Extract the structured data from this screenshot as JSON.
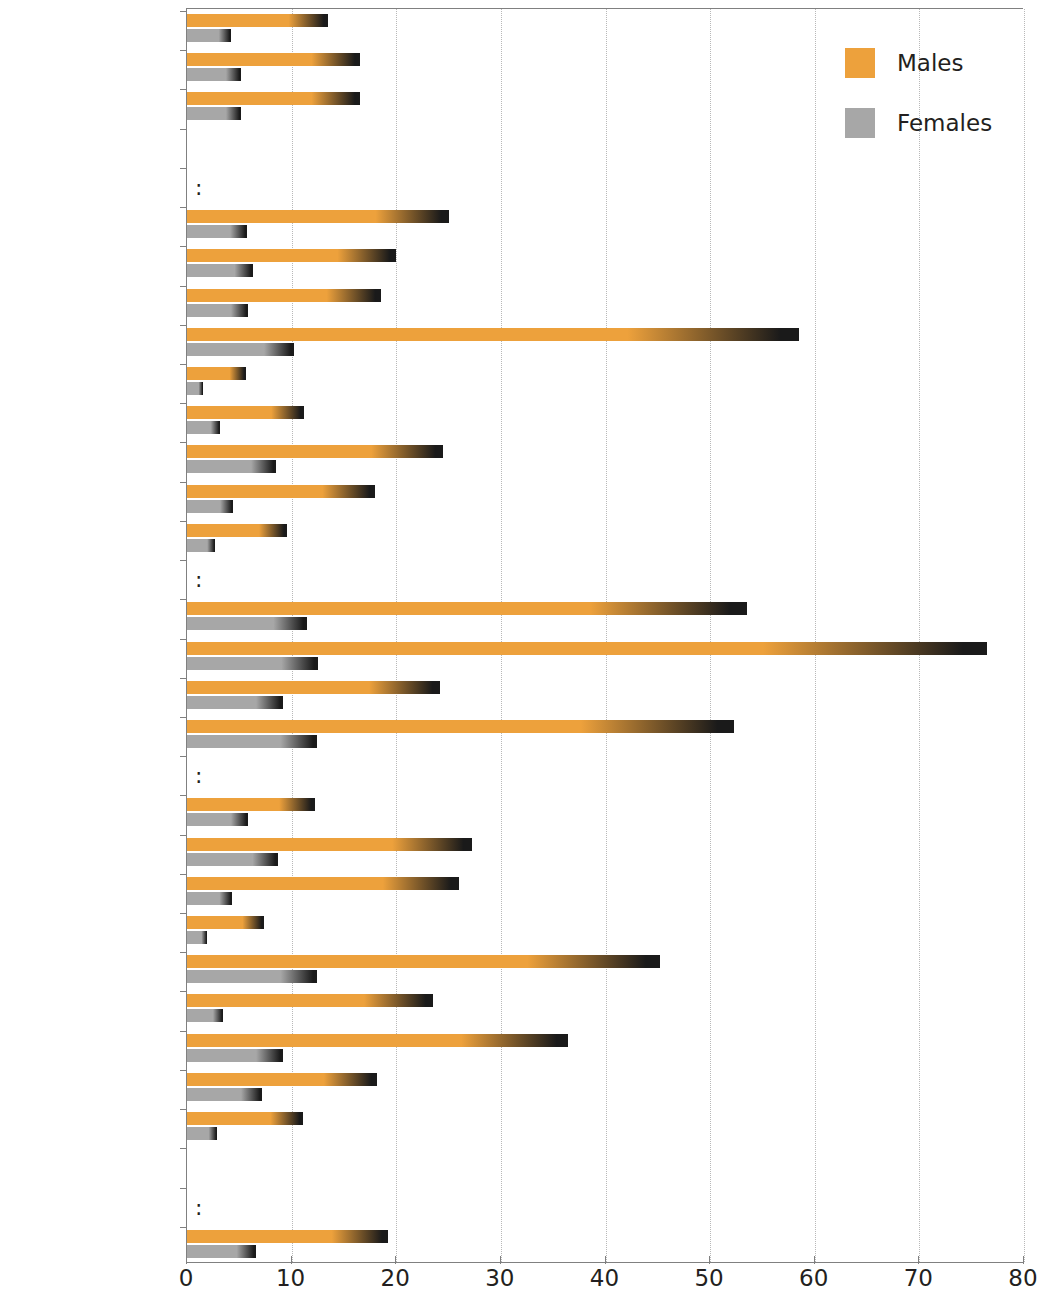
{
  "chart_data": {
    "type": "bar",
    "orientation": "horizontal",
    "title": "",
    "xlabel": "",
    "ylabel": "",
    "xlim": [
      0,
      80
    ],
    "xticks": [
      0,
      10,
      20,
      30,
      40,
      50,
      60,
      70,
      80
    ],
    "grid": "vertical dotted gridlines at each x tick",
    "legend_position": "top-right",
    "no_data_marker": ":",
    "categories": [
      "EU-25",
      "EU-15",
      "Euro-zone",
      "",
      "Belgium",
      "Czech Republic",
      "Denmark",
      "Germany",
      "Estonia",
      "Greece",
      "Spain",
      "France",
      "Ireland",
      "Italy",
      "Cyprus",
      "Latvia",
      "Lithuania",
      "Luxembourg",
      "Hungary",
      "Malta",
      "Netherlands",
      "Austria",
      "Poland",
      "Portugal",
      "Slovenia",
      "Slovakia",
      "Finland",
      "Sweden",
      "United Kingdom",
      "",
      "Iceland",
      "Norway"
    ],
    "series": [
      {
        "name": "Males",
        "color": "#eda13c",
        "values": [
          13.5,
          16.5,
          16.5,
          null,
          null,
          25.0,
          20.0,
          18.5,
          58.5,
          5.6,
          11.2,
          24.5,
          18.0,
          9.6,
          null,
          53.5,
          76.5,
          24.2,
          52.3,
          null,
          12.2,
          27.2,
          26.0,
          7.4,
          45.2,
          23.5,
          36.4,
          18.2,
          11.1,
          null,
          null,
          19.2
        ]
      },
      {
        "name": "Females",
        "color": "#a7a7a7",
        "values": [
          4.2,
          5.2,
          5.2,
          null,
          null,
          5.7,
          6.3,
          5.8,
          10.2,
          1.5,
          3.2,
          8.5,
          4.4,
          2.7,
          null,
          11.5,
          12.5,
          9.2,
          12.4,
          null,
          5.8,
          8.7,
          4.3,
          1.9,
          12.4,
          3.4,
          9.2,
          7.2,
          2.9,
          null,
          null,
          6.6
        ]
      }
    ]
  },
  "legend": {
    "items": [
      {
        "label": "Males",
        "key": "males"
      },
      {
        "label": "Females",
        "key": "females"
      }
    ]
  },
  "axis": {
    "x_tick_labels": [
      "0",
      "10",
      "20",
      "30",
      "40",
      "50",
      "60",
      "70",
      "80"
    ]
  }
}
